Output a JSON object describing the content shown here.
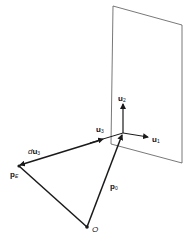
{
  "diagram": {
    "labels": {
      "u2": {
        "base": "u",
        "sub": "2"
      },
      "u1": {
        "base": "u",
        "sub": "1"
      },
      "u3": {
        "base": "u",
        "sub": "3"
      },
      "du3": {
        "prefix": "d",
        "base": "u",
        "sub": "3"
      },
      "pE": {
        "base": "p",
        "sub": "E"
      },
      "p0": {
        "base": "p",
        "sub": "0"
      },
      "origin": "O"
    },
    "colors": {
      "stroke": "#1a1a1a",
      "plane": "#555555",
      "background": "#ffffff"
    }
  }
}
